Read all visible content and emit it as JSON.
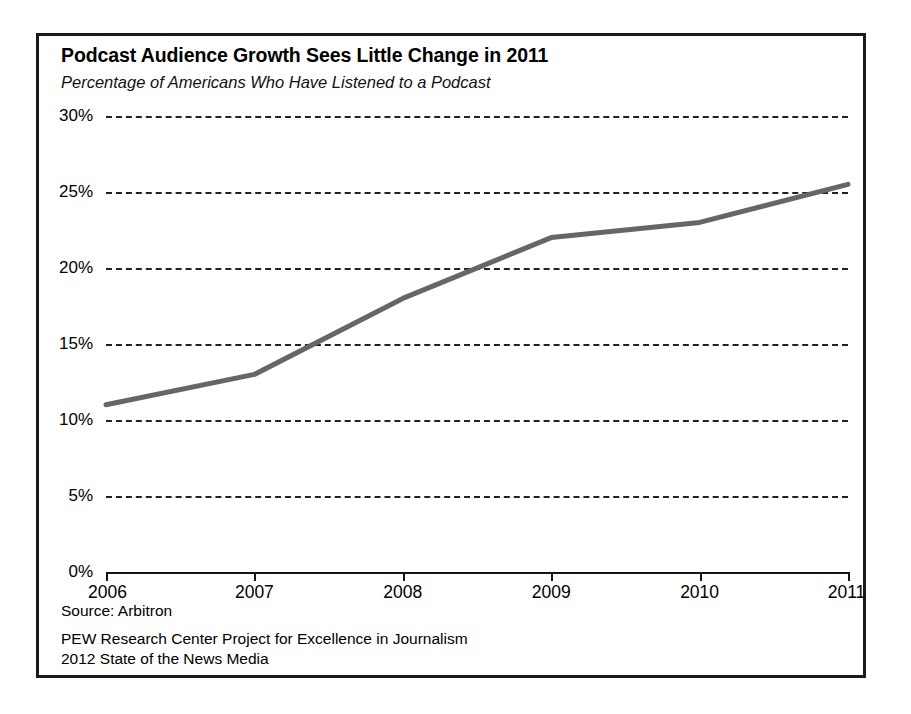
{
  "figure": {
    "title": "Podcast Audience Growth Sees Little Change in 2011",
    "subtitle": "Percentage of Americans Who Have Listened to a Podcast",
    "footer": {
      "source": "Source: Arbitron",
      "organization": "PEW Research Center Project for Excellence in Journalism",
      "publication": "2012 State of the News Media"
    },
    "colors": {
      "line": "#666666",
      "frame": "#1a1a1a",
      "gridline": "#222222",
      "axis": "#151515",
      "background": "#ffffff",
      "text": "#000000"
    }
  },
  "chart_data": {
    "type": "line",
    "title": "Podcast Audience Growth Sees Little Change in 2011",
    "subtitle": "Percentage of Americans Who Have Listened to a Podcast",
    "xlabel": "",
    "ylabel": "",
    "x": [
      2006,
      2007,
      2008,
      2009,
      2010,
      2011
    ],
    "categories": [
      "2006",
      "2007",
      "2008",
      "2009",
      "2010",
      "2011"
    ],
    "values": [
      11,
      13,
      18,
      22,
      23,
      25.5
    ],
    "series": [
      {
        "name": "Percentage of Americans Who Have Listened to a Podcast",
        "values": [
          11,
          13,
          18,
          22,
          23,
          25.5
        ]
      }
    ],
    "ylim": [
      0,
      30
    ],
    "yticks": [
      0,
      5,
      10,
      15,
      20,
      25,
      30
    ],
    "ytick_labels": [
      "0%",
      "5%",
      "10%",
      "15%",
      "20%",
      "25%",
      "30%"
    ],
    "xtick_labels": [
      "2006",
      "2007",
      "2008",
      "2009",
      "2010",
      "2011"
    ],
    "grid": true,
    "grid_style": "dashed",
    "grid_axis": "y",
    "legend": false,
    "legend_position": "none",
    "line_color": "#666666",
    "line_width": 5
  }
}
